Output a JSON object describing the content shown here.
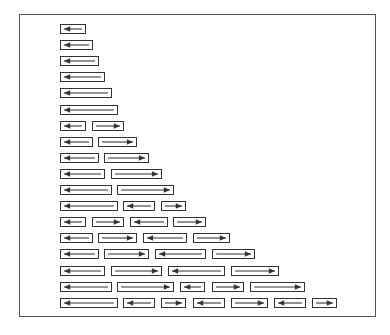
{
  "diagram": {
    "frame": {
      "left": 19,
      "top": 14,
      "width": 357,
      "height": 303
    },
    "line_color": "#333333",
    "row_pitch": 16.1,
    "first_row_top": 24,
    "rows": [
      [
        {
          "x": 60,
          "w": 26,
          "dir": "left"
        }
      ],
      [
        {
          "x": 60,
          "w": 33,
          "dir": "left"
        }
      ],
      [
        {
          "x": 60,
          "w": 39,
          "dir": "left"
        }
      ],
      [
        {
          "x": 60,
          "w": 45,
          "dir": "left"
        }
      ],
      [
        {
          "x": 60,
          "w": 52,
          "dir": "left"
        }
      ],
      [
        {
          "x": 60,
          "w": 58,
          "dir": "left"
        }
      ],
      [
        {
          "x": 60,
          "w": 26,
          "dir": "left"
        },
        {
          "x": 92,
          "w": 32,
          "dir": "right"
        }
      ],
      [
        {
          "x": 60,
          "w": 33,
          "dir": "left"
        },
        {
          "x": 98,
          "w": 39,
          "dir": "right"
        }
      ],
      [
        {
          "x": 60,
          "w": 39,
          "dir": "left"
        },
        {
          "x": 104,
          "w": 45,
          "dir": "right"
        }
      ],
      [
        {
          "x": 60,
          "w": 45,
          "dir": "left"
        },
        {
          "x": 111,
          "w": 51,
          "dir": "right"
        }
      ],
      [
        {
          "x": 60,
          "w": 52,
          "dir": "left"
        },
        {
          "x": 117,
          "w": 57,
          "dir": "right"
        }
      ],
      [
        {
          "x": 60,
          "w": 58,
          "dir": "left"
        },
        {
          "x": 123,
          "w": 32,
          "dir": "left"
        },
        {
          "x": 161,
          "w": 25,
          "dir": "right"
        }
      ],
      [
        {
          "x": 60,
          "w": 26,
          "dir": "left"
        },
        {
          "x": 92,
          "w": 32,
          "dir": "right"
        },
        {
          "x": 130,
          "w": 38,
          "dir": "left"
        },
        {
          "x": 173,
          "w": 33,
          "dir": "right"
        }
      ],
      [
        {
          "x": 60,
          "w": 33,
          "dir": "left"
        },
        {
          "x": 98,
          "w": 39,
          "dir": "right"
        },
        {
          "x": 143,
          "w": 44,
          "dir": "left"
        },
        {
          "x": 193,
          "w": 37,
          "dir": "right"
        }
      ],
      [
        {
          "x": 60,
          "w": 39,
          "dir": "left"
        },
        {
          "x": 104,
          "w": 45,
          "dir": "right"
        },
        {
          "x": 155,
          "w": 51,
          "dir": "left"
        },
        {
          "x": 212,
          "w": 43,
          "dir": "right"
        }
      ],
      [
        {
          "x": 60,
          "w": 45,
          "dir": "left"
        },
        {
          "x": 111,
          "w": 51,
          "dir": "right"
        },
        {
          "x": 168,
          "w": 57,
          "dir": "left"
        },
        {
          "x": 231,
          "w": 48,
          "dir": "right"
        }
      ],
      [
        {
          "x": 60,
          "w": 52,
          "dir": "left"
        },
        {
          "x": 117,
          "w": 57,
          "dir": "right"
        },
        {
          "x": 180,
          "w": 25,
          "dir": "left"
        },
        {
          "x": 212,
          "w": 32,
          "dir": "right"
        },
        {
          "x": 250,
          "w": 55,
          "dir": "right"
        }
      ],
      [
        {
          "x": 60,
          "w": 58,
          "dir": "left"
        },
        {
          "x": 123,
          "w": 32,
          "dir": "left"
        },
        {
          "x": 161,
          "w": 25,
          "dir": "right"
        },
        {
          "x": 193,
          "w": 32,
          "dir": "left"
        },
        {
          "x": 231,
          "w": 37,
          "dir": "right"
        },
        {
          "x": 274,
          "w": 32,
          "dir": "left"
        },
        {
          "x": 312,
          "w": 25,
          "dir": "right"
        }
      ]
    ]
  }
}
